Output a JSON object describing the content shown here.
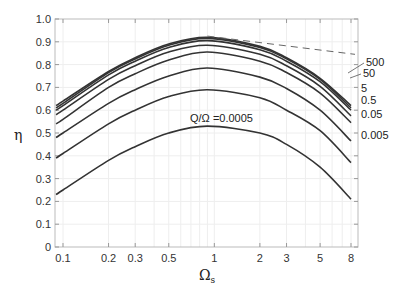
{
  "chart_data": {
    "type": "line",
    "title": "",
    "xlabel": "Ω_s",
    "ylabel": "η",
    "xscale": "log",
    "xlim": [
      0.09,
      9
    ],
    "ylim": [
      0,
      1.0
    ],
    "grid": true,
    "x_ticks": [
      "0.1",
      "0.2",
      "0.3",
      "0.5",
      "1",
      "2",
      "3",
      "5",
      "8"
    ],
    "x_tick_values": [
      0.1,
      0.2,
      0.3,
      0.5,
      1,
      2,
      3,
      5,
      8
    ],
    "y_ticks": [
      "0",
      "0.1",
      "0.2",
      "0.3",
      "0.4",
      "0.5",
      "0.6",
      "0.7",
      "0.8",
      "0.9",
      "1.0"
    ],
    "annotation": "Q/Ω =0.0005",
    "x": [
      0.09,
      0.1,
      0.2,
      0.3,
      0.5,
      0.9,
      2,
      3,
      5,
      8
    ],
    "series": [
      {
        "name": "500",
        "values": [
          0.62,
          0.64,
          0.77,
          0.83,
          0.89,
          0.92,
          0.88,
          0.83,
          0.74,
          0.62
        ]
      },
      {
        "name": "50",
        "values": [
          0.61,
          0.63,
          0.765,
          0.825,
          0.885,
          0.915,
          0.875,
          0.825,
          0.735,
          0.61
        ]
      },
      {
        "name": "5",
        "values": [
          0.6,
          0.62,
          0.755,
          0.815,
          0.875,
          0.905,
          0.865,
          0.815,
          0.725,
          0.6
        ]
      },
      {
        "name": "0.5",
        "values": [
          0.58,
          0.6,
          0.735,
          0.795,
          0.855,
          0.885,
          0.845,
          0.795,
          0.705,
          0.575
        ]
      },
      {
        "name": "0.05",
        "values": [
          0.54,
          0.56,
          0.7,
          0.76,
          0.82,
          0.855,
          0.815,
          0.765,
          0.675,
          0.545
        ]
      },
      {
        "name": "0.005",
        "values": [
          0.48,
          0.5,
          0.63,
          0.69,
          0.75,
          0.785,
          0.745,
          0.695,
          0.6,
          0.465
        ]
      },
      {
        "name": "0.0005",
        "values": [
          0.39,
          0.41,
          0.54,
          0.6,
          0.66,
          0.69,
          0.655,
          0.6,
          0.51,
          0.37
        ]
      },
      {
        "name": "",
        "values": [
          0.23,
          0.25,
          0.38,
          0.44,
          0.5,
          0.53,
          0.5,
          0.45,
          0.35,
          0.21
        ]
      }
    ],
    "dashed_line": {
      "x": [
        0.9,
        8.5
      ],
      "values": [
        0.925,
        0.845
      ]
    },
    "right_labels": [
      "500",
      "50",
      "5",
      "0.5",
      "0.05",
      "0.005"
    ]
  }
}
